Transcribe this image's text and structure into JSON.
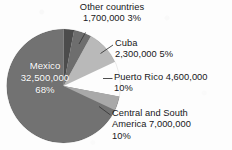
{
  "chart_data": {
    "type": "pie",
    "title": "",
    "subtitle": "",
    "xlabel": "",
    "ylabel": "",
    "legend_position": "none",
    "grid": false,
    "units": "people",
    "categories": [
      "Other countries",
      "Cuba",
      "Puerto Rico",
      "Central and South America",
      "Mexico"
    ],
    "values": [
      1700000,
      2300000,
      4600000,
      7000000,
      32500000
    ],
    "percentages": [
      3,
      5,
      10,
      10,
      68
    ],
    "value_labels": [
      "1,700,000",
      "2,300,000",
      "4,600,000",
      "7,000,000",
      "32,500,000"
    ],
    "percent_labels": [
      "3%",
      "5%",
      "10%",
      "10%",
      "68%"
    ],
    "colors": [
      "#4c4c4c",
      "#6e6e6e",
      "#b9b9b9",
      "#a9a9a9",
      "#727272"
    ],
    "slices": [
      {
        "name": "Other countries",
        "value": 1700000,
        "value_label": "1,700,000",
        "percent": 3,
        "percent_label": "3%",
        "color": "#4c4c4c",
        "start_angle": 0,
        "end_angle": 10.8
      },
      {
        "name": "Cuba",
        "value": 2300000,
        "value_label": "2,300,000",
        "percent": 5,
        "percent_label": "5%",
        "color": "#6e6e6e",
        "start_angle": 10.8,
        "end_angle": 28.8
      },
      {
        "name": "Puerto Rico",
        "value": 4600000,
        "value_label": "4,600,000",
        "percent": 10,
        "percent_label": "10%",
        "color": "#b9b9b9",
        "start_angle": 28.8,
        "end_angle": 64.8
      },
      {
        "name": "Central and South America",
        "value": 7000000,
        "value_label": "7,000,000",
        "percent": 10,
        "percent_label": "10%",
        "color": "#a9a9a9",
        "start_angle": 64.8,
        "end_angle": 100.8
      },
      {
        "name": "Mexico",
        "value": 32500000,
        "value_label": "32,500,000",
        "percent": 68,
        "percent_label": "68%",
        "color": "#727272",
        "start_angle": 100.8,
        "end_angle": 360
      }
    ]
  },
  "labels": {
    "other_countries": {
      "name": "Other countries",
      "line1": "Other countries",
      "line2": "1,700,000  3%"
    },
    "cuba": {
      "name": "Cuba",
      "line1": "Cuba",
      "line2": "2,300,000  5%"
    },
    "puerto_rico": {
      "name": "Puerto Rico",
      "line1": "Puerto Rico  4,600,000",
      "line2": "10%"
    },
    "central_south_america": {
      "name": "Central and South America",
      "line1": "Central and South",
      "line2": "America  7,000,000",
      "line3": "10%"
    },
    "mexico": {
      "name": "Mexico",
      "line1": "Mexico",
      "line2": "32,500,000",
      "line3": "68%"
    }
  },
  "style": {
    "background": "#fdfdfd",
    "text_color": "#17171a",
    "inside_label_color": "#ffffff",
    "leader_line_color": "#3a3a3a"
  }
}
